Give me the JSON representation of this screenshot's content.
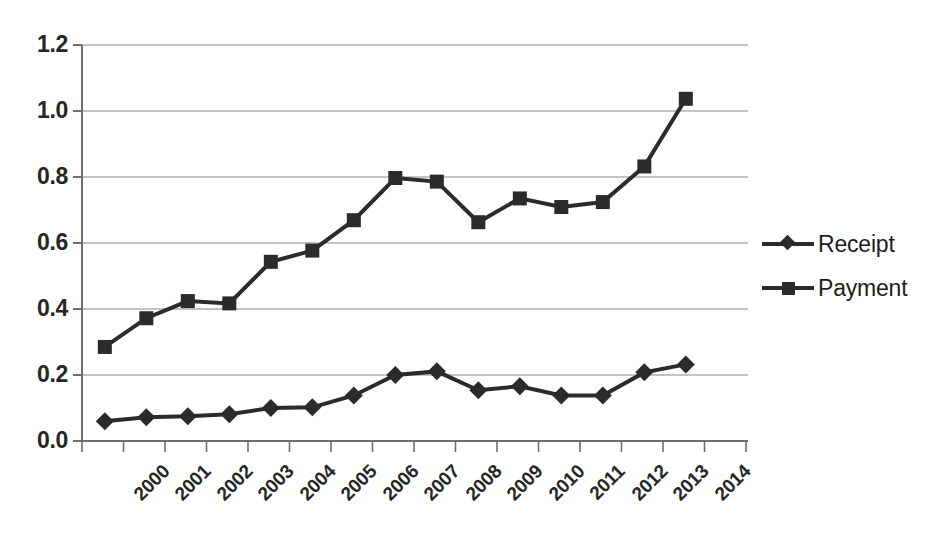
{
  "chart_data": {
    "type": "line",
    "title": "",
    "subtitle": "",
    "xlabel": "",
    "ylabel": "",
    "categories": [
      "2000",
      "2001",
      "2002",
      "2003",
      "2004",
      "2005",
      "2006",
      "2007",
      "2008",
      "2009",
      "2010",
      "2011",
      "2012",
      "2013",
      "2014"
    ],
    "series": [
      {
        "name": "Receipt",
        "marker": "diamond",
        "color": "#2b2b2b",
        "values": [
          0.06,
          0.072,
          0.075,
          0.081,
          0.1,
          0.102,
          0.138,
          0.2,
          0.211,
          0.154,
          0.166,
          0.138,
          0.138,
          0.208,
          0.232
        ]
      },
      {
        "name": "Payment",
        "marker": "square",
        "color": "#2b2b2b",
        "values": [
          0.285,
          0.372,
          0.424,
          0.417,
          0.543,
          0.577,
          0.669,
          0.797,
          0.786,
          0.663,
          0.735,
          0.709,
          0.724,
          0.832,
          1.037
        ]
      }
    ],
    "ylim": [
      0.0,
      1.2
    ],
    "yticks": [
      "0.0",
      "0.2",
      "0.4",
      "0.6",
      "0.8",
      "1.0",
      "1.2"
    ],
    "ytick_values": [
      0.0,
      0.2,
      0.4,
      0.6,
      0.8,
      1.0,
      1.2
    ],
    "grid": "horizontal",
    "legend_position": "right",
    "legend_entries": [
      "Receipt",
      "Payment"
    ]
  },
  "legend": {
    "receipt_label": "Receipt",
    "payment_label": "Payment"
  }
}
